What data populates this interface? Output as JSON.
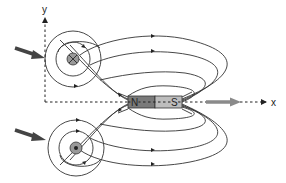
{
  "diagram": {
    "axes": {
      "y_label": "y",
      "x_label": "x"
    },
    "magnet": {
      "north_label": "N",
      "south_label": "S",
      "north_color": "#7a7a7a",
      "south_color": "#bdbdbd"
    },
    "wires": [
      {
        "name": "upper-wire",
        "symbol": "current-into-page (⊗)"
      },
      {
        "name": "lower-wire",
        "symbol": "current-out-of-page (⊙)"
      }
    ],
    "arrows": {
      "force_arrow_color": "#444444",
      "motion_arrow_color": "#8a8a8a"
    },
    "colors": {
      "line": "#333333",
      "background": "#ffffff"
    }
  }
}
